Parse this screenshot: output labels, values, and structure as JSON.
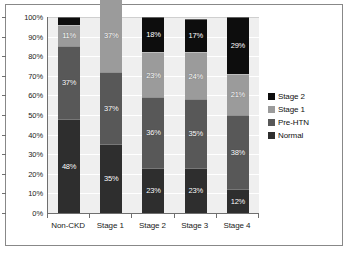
{
  "chart_data": {
    "type": "bar",
    "subtype": "stacked-percentage",
    "title": "",
    "subtitle": "",
    "xlabel": "",
    "ylabel": "",
    "categories": [
      "Non-CKD",
      "Stage 1",
      "Stage 2",
      "Stage 3",
      "Stage 4"
    ],
    "ylim": [
      0,
      100
    ],
    "yticks": [
      "0%",
      "10%",
      "20%",
      "30%",
      "40%",
      "50%",
      "60%",
      "70%",
      "80%",
      "90%",
      "100%"
    ],
    "ytick_values": [
      0,
      10,
      20,
      30,
      40,
      50,
      60,
      70,
      80,
      90,
      100
    ],
    "grid": true,
    "grid_axis": "y",
    "legend_position": "right",
    "stack_order_bottom_to_top": [
      "Normal",
      "Pre-HTN",
      "Stage 1",
      "Stage 2"
    ],
    "series": [
      {
        "name": "Normal",
        "color": "#2e2e2e",
        "values": [
          48,
          35,
          23,
          23,
          12
        ],
        "labels": [
          "48%",
          "35%",
          "23%",
          "23%",
          "12%"
        ]
      },
      {
        "name": "Pre-HTN",
        "color": "#585858",
        "values": [
          37,
          37,
          36,
          35,
          38
        ],
        "labels": [
          "37%",
          "37%",
          "36%",
          "35%",
          "38%"
        ]
      },
      {
        "name": "Stage 1",
        "color": "#9b9b9b",
        "values": [
          11,
          37,
          23,
          24,
          21
        ],
        "labels": [
          "11%",
          "37%",
          "23%",
          "24%",
          "21%"
        ]
      },
      {
        "name": "Stage 2",
        "color": "#0d0d0d",
        "values": [
          4,
          11,
          18,
          17,
          29
        ],
        "labels": [
          "",
          "11%",
          "18%",
          "17%",
          "29%"
        ]
      }
    ]
  },
  "legend": {
    "items": [
      {
        "label": "Stage 2",
        "color": "#0d0d0d"
      },
      {
        "label": "Stage 1",
        "color": "#9b9b9b"
      },
      {
        "label": "Pre-HTN",
        "color": "#585858"
      },
      {
        "label": "Normal",
        "color": "#2e2e2e"
      }
    ]
  },
  "axes": {
    "y_tick_labels": [
      "100%",
      "90%",
      "80%",
      "70%",
      "60%",
      "50%",
      "40%",
      "30%",
      "20%",
      "10%",
      "0%"
    ],
    "x_tick_labels": [
      "Non-CKD",
      "Stage 1",
      "Stage 2",
      "Stage 3",
      "Stage 4"
    ]
  },
  "colors": {
    "plot_background": "#efefef",
    "gridline": "#ffffff",
    "axis_line": "#6f6f6f",
    "frame_border": "#888888",
    "page_background": "#ffffff",
    "label_text": "#ffffff"
  }
}
